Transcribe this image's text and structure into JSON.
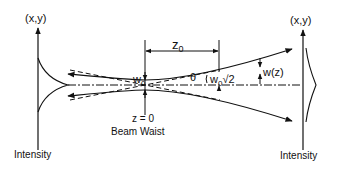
{
  "diagram": {
    "labels": {
      "left_axis": "(x,y)",
      "right_axis": "(x,y)",
      "left_intensity": "Intensity",
      "right_intensity": "Intensity",
      "rayleigh_range": "z",
      "rayleigh_sub": "0",
      "waist_w": "w",
      "waist_sub": "0",
      "angle": "θ",
      "waist_root2_w": "w",
      "waist_root2_sub": "0",
      "root2": "√2",
      "wz": "w(z)",
      "z_zero": "z = 0",
      "beam_waist": "Beam Waist"
    },
    "colors": {
      "line": "#111111",
      "background": "#ffffff"
    }
  }
}
